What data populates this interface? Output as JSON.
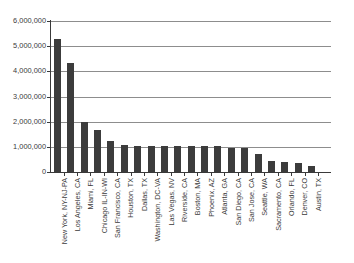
{
  "chart_data": {
    "type": "bar",
    "title": "",
    "subtitle": "",
    "xlabel": "",
    "ylabel": "",
    "ylim": [
      0,
      6000000
    ],
    "ytick_values": [
      0,
      1000000,
      2000000,
      3000000,
      4000000,
      5000000,
      6000000
    ],
    "ytick_labels": [
      "0",
      "1,000,000",
      "2,000,000",
      "3,000,000",
      "4,000,000",
      "5,000,000",
      "6,000,000"
    ],
    "grid": true,
    "legend": false,
    "legend_position": "none",
    "bar_color": "#3c3c3c",
    "gridline_color": "#8d8d8d",
    "axis_color": "#3a3a3a",
    "background_color": "#ffffff",
    "categories": [
      "New York, NY-NJ-PA",
      "Los Angeles, CA",
      "Miami, FL",
      "Chicago IL-IN-WI",
      "San Francisco, CA",
      "Houston, TX",
      "Dallas, TX",
      "Washington, DC-VA",
      "Las Vegas, NV",
      "Riverside, CA",
      "Boston, MA",
      "Phoenix, AZ",
      "Atlanta, GA",
      "San Diego, CA",
      "San Jose, CA",
      "Seattle, WA",
      "Sacramento, CA",
      "Orlando, FL",
      "Denver, CO",
      "Austin, TX"
    ],
    "values": [
      5300000,
      4350000,
      2000000,
      1650000,
      1250000,
      1080000,
      1030000,
      1030000,
      1030000,
      1030000,
      1030000,
      1030000,
      1020000,
      950000,
      940000,
      700000,
      450000,
      400000,
      370000,
      250000
    ]
  }
}
